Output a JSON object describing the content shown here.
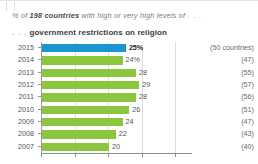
{
  "header": {
    "kicker_prefix": "% of ",
    "kicker_bold": "198 countries",
    "kicker_suffix": " with high or very high levels of ",
    "kicker_dots": ". . .",
    "subhead_dots": ". . .",
    "subhead_text": "government restrictions on religion"
  },
  "colors": {
    "highlight_bar": "#1b95d2",
    "bar": "#8cc63e",
    "gridline": "#dcdcdc",
    "axis": "#8c8c8c"
  },
  "chart_data": {
    "type": "bar",
    "orientation": "horizontal",
    "title": "government restrictions on religion",
    "subtitle": "% of 198 countries with high or very high levels of . . .",
    "xlabel": "",
    "ylabel": "",
    "xlim": [
      0,
      45
    ],
    "grid": true,
    "gridline_values": [
      0,
      10,
      20,
      30,
      40
    ],
    "legend": "none",
    "categories": [
      "2015",
      "2014",
      "2013",
      "2012",
      "2011",
      "2010",
      "2009",
      "2008",
      "2007"
    ],
    "values": [
      25,
      24,
      28,
      29,
      28,
      26,
      24,
      22,
      20
    ],
    "value_labels": [
      "25%",
      "24%",
      "28",
      "29",
      "28",
      "26",
      "24",
      "22",
      "20"
    ],
    "highlight_index": 0,
    "annotations": [
      "(50 countries)",
      "(47)",
      "(55)",
      "(57)",
      "(56)",
      "(51)",
      "(47)",
      "(43)",
      "(40)"
    ],
    "rows": [
      {
        "year": "2015",
        "value": 25,
        "label": "25%",
        "count": "(50 countries)",
        "highlight": true
      },
      {
        "year": "2014",
        "value": 24,
        "label": "24%",
        "count": "(47)",
        "highlight": false
      },
      {
        "year": "2013",
        "value": 28,
        "label": "28",
        "count": "(55)",
        "highlight": false
      },
      {
        "year": "2012",
        "value": 29,
        "label": "29",
        "count": "(57)",
        "highlight": false
      },
      {
        "year": "2011",
        "value": 28,
        "label": "28",
        "count": "(56)",
        "highlight": false
      },
      {
        "year": "2010",
        "value": 26,
        "label": "26",
        "count": "(51)",
        "highlight": false
      },
      {
        "year": "2009",
        "value": 24,
        "label": "24",
        "count": "(47)",
        "highlight": false
      },
      {
        "year": "2008",
        "value": 22,
        "label": "22",
        "count": "(43)",
        "highlight": false
      },
      {
        "year": "2007",
        "value": 20,
        "label": "20",
        "count": "(40)",
        "highlight": false
      }
    ]
  }
}
